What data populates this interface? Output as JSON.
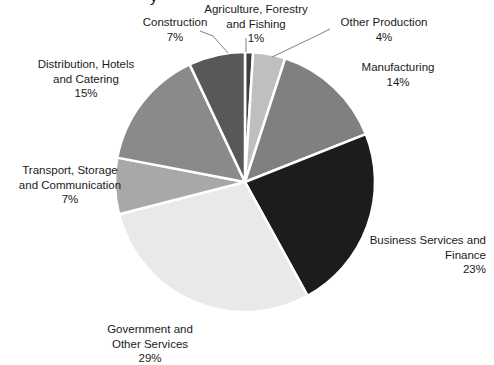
{
  "chart_data": {
    "type": "pie",
    "title": "",
    "title_fragment_visible": "y",
    "xlabel": "",
    "ylabel": "",
    "legend": "none (direct data labels with leader lines)",
    "grid": false,
    "start_angle_deg": 0,
    "direction": "clockwise",
    "categories": [
      "Agriculture, Forestry and Fishing",
      "Other Production",
      "Manufacturing",
      "Business Services and Finance",
      "Government and Other Services",
      "Transport, Storage and Communication",
      "Distribution, Hotels and Catering",
      "Construction"
    ],
    "values": [
      1,
      4,
      14,
      23,
      29,
      7,
      15,
      7
    ],
    "value_labels": [
      "1%",
      "4%",
      "14%",
      "23%",
      "29%",
      "7%",
      "15%",
      "7%"
    ],
    "colors": [
      "#3F3F3F",
      "#BFBFBF",
      "#808080",
      "#1C1C1C",
      "#E9E9E9",
      "#A8A8A8",
      "#8A8A8A",
      "#585858"
    ],
    "slice_separator_color": "#FFFFFF",
    "slices": [
      {
        "name": "Agriculture, Forestry and Fishing",
        "label_lines": [
          "Agriculture, Forestry",
          "and Fishing"
        ],
        "percent": "1%",
        "value": 1,
        "color": "#3F3F3F",
        "leader_line": true
      },
      {
        "name": "Other Production",
        "label_lines": [
          "Other Production"
        ],
        "percent": "4%",
        "value": 4,
        "color": "#BFBFBF",
        "leader_line": true
      },
      {
        "name": "Manufacturing",
        "label_lines": [
          "Manufacturing"
        ],
        "percent": "14%",
        "value": 14,
        "color": "#808080",
        "leader_line": false
      },
      {
        "name": "Business Services and Finance",
        "label_lines": [
          "Business Services and",
          "Finance"
        ],
        "percent": "23%",
        "value": 23,
        "color": "#1C1C1C",
        "leader_line": false
      },
      {
        "name": "Government and Other Services",
        "label_lines": [
          "Government and",
          "Other Services"
        ],
        "percent": "29%",
        "value": 29,
        "color": "#E9E9E9",
        "leader_line": false
      },
      {
        "name": "Transport, Storage and Communication",
        "label_lines": [
          "Transport, Storage",
          "and Communication"
        ],
        "percent": "7%",
        "value": 7,
        "color": "#A8A8A8",
        "leader_line": false
      },
      {
        "name": "Distribution, Hotels and Catering",
        "label_lines": [
          "Distribution, Hotels",
          "and Catering"
        ],
        "percent": "15%",
        "value": 15,
        "color": "#8A8A8A",
        "leader_line": false
      },
      {
        "name": "Construction",
        "label_lines": [
          "Construction"
        ],
        "percent": "7%",
        "value": 7,
        "color": "#585858",
        "leader_line": true
      }
    ]
  },
  "labels": {
    "agriculture": {
      "line1": "Agriculture, Forestry",
      "line2": "and Fishing",
      "pct": "1%"
    },
    "other_production": {
      "line1": "Other Production",
      "pct": "4%"
    },
    "construction": {
      "line1": "Construction",
      "pct": "7%"
    },
    "distribution": {
      "line1": "Distribution, Hotels",
      "line2": "and Catering",
      "pct": "15%"
    },
    "manufacturing": {
      "line1": "Manufacturing",
      "pct": "14%"
    },
    "transport": {
      "line1": "Transport, Storage",
      "line2": "and Communication",
      "pct": "7%"
    },
    "business": {
      "line1": "Business Services and",
      "line2": "Finance",
      "pct": "23%"
    },
    "government": {
      "line1": "Government and",
      "line2": "Other Services",
      "pct": "29%"
    }
  }
}
